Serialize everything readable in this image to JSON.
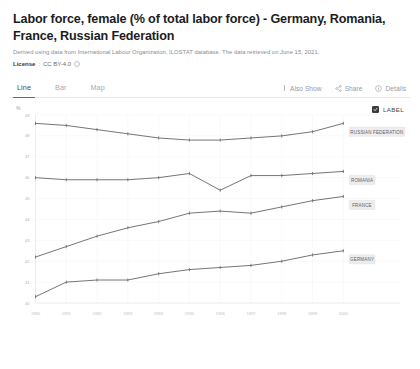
{
  "header": {
    "title": "Labor force, female (% of total labor force) - Germany, Romania, France, Russian Federation",
    "subtitle": "Derived using data from International Labour Organization, ILOSTAT database. The data retrieved on June 15, 2021.",
    "license_label": "License",
    "license_separator": ":",
    "license_value": "CC BY-4.0",
    "info_icon": "info-circle-icon"
  },
  "tabs": [
    {
      "label": "Line",
      "active": true
    },
    {
      "label": "Bar",
      "active": false
    },
    {
      "label": "Map",
      "active": false
    }
  ],
  "toolbar": [
    {
      "label": "Also Show",
      "icon": "bars-icon"
    },
    {
      "label": "Share",
      "icon": "share-icon"
    },
    {
      "label": "Details",
      "icon": "info-circle-icon"
    }
  ],
  "chart_controls": {
    "label_toggle_text": "LABEL",
    "label_toggle_checked": true,
    "check_icon": "check-icon"
  },
  "chart_data": {
    "type": "line",
    "title": "Labor force, female (% of total labor force) - Germany, Romania, France, Russian Federation",
    "xlabel": "",
    "ylabel": "%",
    "axis_unit": "%",
    "grid": true,
    "legend_position": "right-inline",
    "categories": [
      "1990",
      "1991",
      "1992",
      "1993",
      "1994",
      "1995",
      "1996",
      "1997",
      "1998",
      "1999",
      "2000"
    ],
    "ylim": [
      40,
      49
    ],
    "yticks": [
      "49",
      "48",
      "47",
      "46",
      "45",
      "44",
      "43",
      "42",
      "41",
      "40"
    ],
    "series": [
      {
        "name": "RUSSIAN FEDERATION",
        "color": "#5a5a5f",
        "values": [
          48.6,
          48.5,
          48.3,
          48.1,
          47.9,
          47.8,
          47.8,
          47.9,
          48.0,
          48.2,
          48.6
        ]
      },
      {
        "name": "ROMANIA",
        "color": "#5a5a5f",
        "values": [
          46.0,
          45.9,
          45.9,
          45.9,
          46.0,
          46.2,
          45.4,
          46.1,
          46.1,
          46.2,
          46.3
        ]
      },
      {
        "name": "FRANCE",
        "color": "#5a5a5f",
        "values": [
          42.2,
          42.7,
          43.2,
          43.6,
          43.9,
          44.3,
          44.4,
          44.3,
          44.6,
          44.9,
          45.1
        ]
      },
      {
        "name": "GERMANY",
        "color": "#5a5a5f",
        "values": [
          40.3,
          41.0,
          41.1,
          41.1,
          41.4,
          41.6,
          41.7,
          41.8,
          42.0,
          42.3,
          42.5
        ]
      }
    ]
  }
}
